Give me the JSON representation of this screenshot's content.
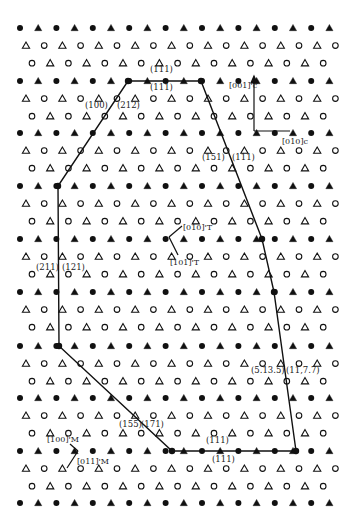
{
  "figure": {
    "lattice": {
      "origin_x": 20,
      "spacing_x": 18.2,
      "filled_rows_y": [
        28,
        81,
        133,
        186,
        239,
        292,
        346,
        398,
        451,
        503
      ],
      "row_gap": 17.6,
      "columns": 18,
      "ink_color": "#111111"
    },
    "polygon": {
      "points": [
        [
          128,
          81
        ],
        [
          201,
          81
        ],
        [
          262,
          239
        ],
        [
          274,
          292
        ],
        [
          296,
          451
        ],
        [
          172,
          451
        ],
        [
          59,
          346
        ],
        [
          58,
          186
        ]
      ],
      "stroke": "#111111"
    },
    "labels": {
      "l111_top_a": "(111)",
      "l111_top_b": "(111)",
      "l100": "(100)",
      "l212": "(212)",
      "l151": "(151)",
      "l111_right": "(111)",
      "l211": "(211)",
      "l121": "(121)",
      "l5135": "(5.13.5)",
      "l1177": "(11,7.7)",
      "l155": "(155)",
      "l171": "(171)",
      "l111_bot_a": "(111)",
      "l111_bot_b": "(111)",
      "v001c": "[001]'c",
      "v010c": "[010]c",
      "v010t": "[010]'T",
      "v101t": "[101]'T",
      "v100m": "[100]'M",
      "v011m": "[011]'M"
    }
  }
}
